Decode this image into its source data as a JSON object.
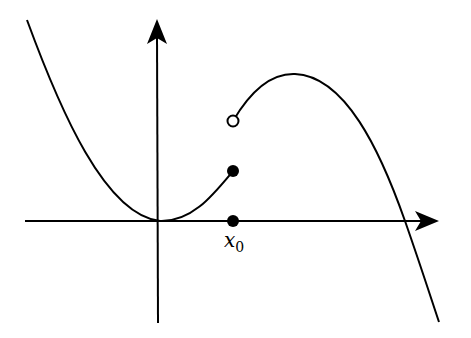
{
  "diagram": {
    "type": "piecewise-function-discontinuity",
    "axes": {
      "x_axis": {
        "from": [
          25,
          221
        ],
        "to": [
          439,
          221
        ],
        "arrow": true
      },
      "y_axis": {
        "from": [
          164,
          323
        ],
        "to": [
          157,
          19
        ],
        "arrow": true
      }
    },
    "curves": {
      "left_branch": "M27,20 C60,110 110,215 164,221 C195,222 215,195 233,171",
      "right_branch": "M233,121 C250,95 270,72 295,74 C345,78 380,150 405,221 C420,260 430,295 439,322"
    },
    "points": {
      "filled_value": {
        "x": 233,
        "y": 171,
        "style": "filled"
      },
      "open_limit": {
        "x": 233,
        "y": 121,
        "style": "open"
      },
      "axis_point": {
        "x": 233,
        "y": 221,
        "style": "filled"
      }
    },
    "labels": {
      "x0_main": "x",
      "x0_sub": "0"
    },
    "colors": {
      "stroke": "#000000",
      "background": "#ffffff"
    }
  }
}
